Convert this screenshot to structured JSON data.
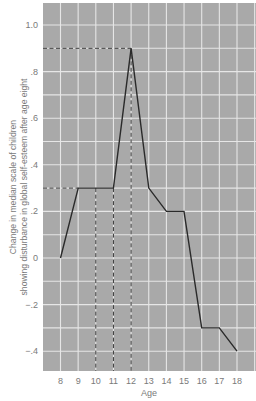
{
  "chart_data": {
    "type": "line",
    "title": "",
    "xlabel": "Age",
    "ylabel": "Change in median scale of children showing disturbance in global self-esteem after age eight",
    "ylabel_lines": [
      "Change in median scale of children",
      "showing disturbance in global self-esteem after age eight"
    ],
    "x": [
      8,
      9,
      10,
      11,
      12,
      13,
      14,
      15,
      16,
      17,
      18
    ],
    "series": [
      {
        "name": "Median change",
        "values": [
          0.0,
          0.3,
          0.3,
          0.3,
          0.9,
          0.3,
          0.2,
          0.2,
          -0.3,
          -0.3,
          -0.4
        ]
      }
    ],
    "x_ticks": [
      "8",
      "9",
      "10",
      "11",
      "12",
      "13",
      "14",
      "15",
      "16",
      "17",
      "18"
    ],
    "y_ticks": [
      {
        "value": 1.0,
        "label": "1.0"
      },
      {
        "value": 0.8,
        "label": ".8"
      },
      {
        "value": 0.6,
        "label": ".6"
      },
      {
        "value": 0.4,
        "label": ".4"
      },
      {
        "value": 0.2,
        "label": ".2"
      },
      {
        "value": 0.0,
        "label": "0"
      },
      {
        "value": -0.2,
        "label": "−.2"
      },
      {
        "value": -0.4,
        "label": "−.4"
      }
    ],
    "ylim": [
      -0.48,
      1.09
    ],
    "xlim": [
      7,
      19
    ],
    "grid": true,
    "grid_step_y": 0.1,
    "grid_step_x": 1,
    "reference_lines": [
      {
        "type": "horizontal",
        "value": 0.9,
        "from_x": 7,
        "to_x": 12,
        "style": "dashed"
      },
      {
        "type": "horizontal",
        "value": 0.3,
        "from_x": 7,
        "to_x": 9,
        "style": "dashed"
      },
      {
        "type": "vertical",
        "x": 10,
        "from_value": 0.3,
        "style": "dashed"
      },
      {
        "type": "vertical",
        "x": 11,
        "from_value": 0.3,
        "style": "dashed"
      },
      {
        "type": "vertical",
        "x": 12,
        "from_value": 0.9,
        "style": "dashed"
      }
    ],
    "legend": null
  },
  "colors": {
    "plot_background": "#a9a9a9",
    "grid_line": "#e6e6e6",
    "data_line": "#2a2a2a",
    "dashed_line": "#3a3a3a",
    "text": "#7a7a7a"
  }
}
